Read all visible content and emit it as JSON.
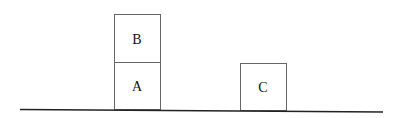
{
  "diagram": {
    "type": "blocks-world",
    "blocks": [
      {
        "label": "B",
        "x": 114,
        "y": 14,
        "w": 46,
        "h": 48
      },
      {
        "label": "A",
        "x": 114,
        "y": 62,
        "w": 46,
        "h": 47
      },
      {
        "label": "C",
        "x": 240,
        "y": 63,
        "w": 46,
        "h": 47
      }
    ],
    "ground": {
      "x1": 20,
      "y1": 109,
      "x2": 383,
      "y2": 112
    },
    "colors": {
      "stroke": "#555555",
      "ground": "#222222",
      "text": "#111111"
    }
  }
}
